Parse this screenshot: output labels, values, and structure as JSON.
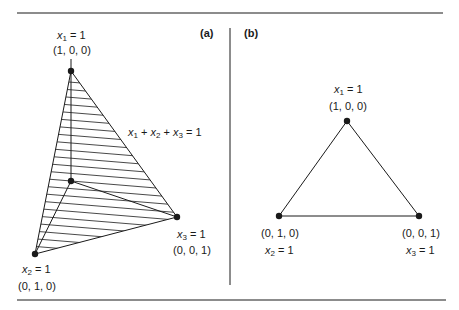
{
  "figure": {
    "panel_a": {
      "label": "(a)",
      "plane_equation": {
        "parts": [
          [
            "x",
            "1"
          ],
          [
            "x",
            "2"
          ],
          [
            "x",
            "3"
          ]
        ],
        "separator": " + ",
        "rhs": " = 1"
      },
      "vertices": [
        {
          "id": "x1",
          "var": "x",
          "sub": "1",
          "eq": " = 1",
          "coords": "(1, 0, 0)"
        },
        {
          "id": "x2",
          "var": "x",
          "sub": "2",
          "eq": " = 1",
          "coords": "(0, 1, 0)"
        },
        {
          "id": "x3",
          "var": "x",
          "sub": "3",
          "eq": " = 1",
          "coords": "(0, 0, 1)"
        }
      ],
      "origin_shown": true,
      "shaded_region": "hatched simplex x1 + x2 + x3 = 1"
    },
    "panel_b": {
      "label": "(b)",
      "vertices": [
        {
          "id": "x1",
          "var": "x",
          "sub": "1",
          "eq": " = 1",
          "coords": "(1, 0, 0)"
        },
        {
          "id": "x2",
          "var": "x",
          "sub": "2",
          "eq": " = 1",
          "coords": "(0, 1, 0)"
        },
        {
          "id": "x3",
          "var": "x",
          "sub": "3",
          "eq": " = 1",
          "coords": "(0, 0, 1)"
        }
      ]
    },
    "colors": {
      "ink": "#1a1a1a",
      "background": "#ffffff"
    }
  }
}
